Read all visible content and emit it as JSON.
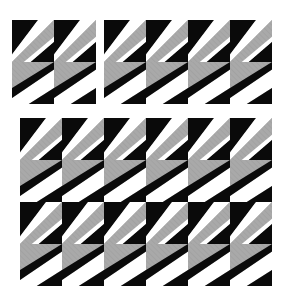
{
  "figure": {
    "background_color": "#ffffff",
    "width": 286,
    "height": 306
  },
  "palette": {
    "black": "#0a0a0a",
    "white": "#ffffff",
    "gray": "#a9a9a9",
    "gray_dark": "#8e8e8e",
    "hatch_line": "#9a9a9a",
    "panel_background": "#ffffff"
  },
  "tile": {
    "size_px": 42,
    "variants": [
      {
        "id": "A",
        "name": "tile-variant-a",
        "description": "Black wedge upper-left, white diagonal band, gray hatched lower-right"
      },
      {
        "id": "B",
        "name": "tile-variant-b",
        "description": "Gray hatched upper-left, white diagonal band, black wedge lower-right"
      }
    ]
  },
  "panels": [
    {
      "name": "panel-top-left",
      "label": "Panel 1",
      "cols": 2,
      "rows": 2,
      "x": 12,
      "y": 20,
      "tile_size": 42,
      "row_variants": [
        "A",
        "B"
      ]
    },
    {
      "name": "panel-top-right",
      "label": "Panel 2",
      "cols": 4,
      "rows": 2,
      "x": 104,
      "y": 20,
      "tile_size": 42,
      "row_variants": [
        "A",
        "B"
      ]
    },
    {
      "name": "panel-bottom",
      "label": "Panel 3",
      "cols": 6,
      "rows": 4,
      "x": 20,
      "y": 118,
      "tile_size": 42,
      "row_variants": [
        "A",
        "B",
        "A",
        "B"
      ]
    }
  ]
}
